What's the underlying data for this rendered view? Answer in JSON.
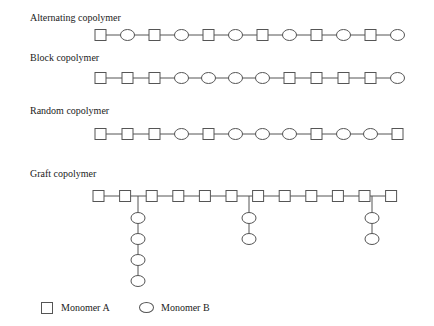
{
  "diagram": {
    "rows": [
      {
        "title": "Alternating copolymer",
        "label_y": 12,
        "chain_y": 35,
        "start_x": 95,
        "pitch": 27,
        "units": [
          "A",
          "B",
          "A",
          "B",
          "A",
          "B",
          "A",
          "B",
          "A",
          "B",
          "A",
          "B"
        ]
      },
      {
        "title": "Block copolymer",
        "label_y": 52,
        "chain_y": 78,
        "start_x": 95,
        "pitch": 27,
        "units": [
          "A",
          "A",
          "A",
          "B",
          "B",
          "B",
          "B",
          "A",
          "A",
          "A",
          "A",
          "B"
        ]
      },
      {
        "title": "Random copolymer",
        "label_y": 105,
        "chain_y": 134,
        "start_x": 95,
        "pitch": 27,
        "units": [
          "A",
          "A",
          "A",
          "B",
          "A",
          "B",
          "B",
          "B",
          "A",
          "B",
          "B",
          "A"
        ]
      }
    ],
    "graft": {
      "title": "Graft copolymer",
      "label_y": 168,
      "chain_y": 196,
      "start_x": 93,
      "pitch": 26.6,
      "backbone": [
        "A",
        "A",
        "A",
        "A",
        "A",
        "A",
        "A",
        "A",
        "A",
        "A",
        "A",
        "A"
      ],
      "branches": [
        {
          "x": 138,
          "units": [
            "B",
            "B",
            "B",
            "B"
          ]
        },
        {
          "x": 249,
          "units": [
            "B",
            "B"
          ]
        },
        {
          "x": 372,
          "units": [
            "B",
            "B"
          ]
        }
      ]
    },
    "legend": {
      "monomer_a": "Monomer A",
      "monomer_b": "Monomer B"
    },
    "colors": {
      "stroke": "#555555",
      "text": "#222222"
    }
  }
}
